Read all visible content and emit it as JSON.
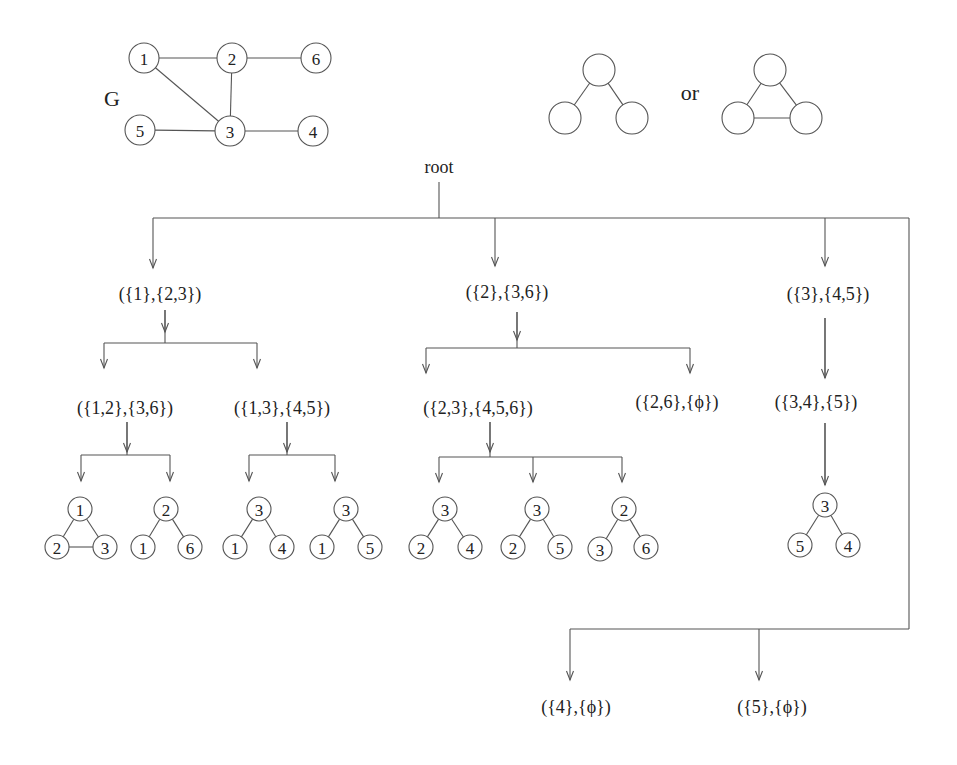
{
  "graph": {
    "label": "G",
    "label_pos": [
      112,
      98
    ],
    "node_radius": 15,
    "nodes": [
      {
        "id": "1",
        "x": 144,
        "y": 58
      },
      {
        "id": "2",
        "x": 232,
        "y": 58
      },
      {
        "id": "6",
        "x": 316,
        "y": 58
      },
      {
        "id": "5",
        "x": 140,
        "y": 130
      },
      {
        "id": "3",
        "x": 230,
        "y": 131
      },
      {
        "id": "4",
        "x": 313,
        "y": 131
      }
    ],
    "edges": [
      [
        "1",
        "2"
      ],
      [
        "2",
        "6"
      ],
      [
        "1",
        "3"
      ],
      [
        "2",
        "3"
      ],
      [
        "5",
        "3"
      ],
      [
        "3",
        "4"
      ]
    ]
  },
  "patterns": {
    "connector": "or",
    "connector_pos": [
      690,
      92
    ],
    "node_radius": 16,
    "items": [
      {
        "name": "path-pattern",
        "nodes": [
          [
            599,
            70
          ],
          [
            565,
            118
          ],
          [
            632,
            118
          ]
        ],
        "edges": [
          [
            0,
            1
          ],
          [
            0,
            2
          ]
        ]
      },
      {
        "name": "triangle-pattern",
        "nodes": [
          [
            770,
            70
          ],
          [
            738,
            118
          ],
          [
            806,
            118
          ]
        ],
        "edges": [
          [
            0,
            1
          ],
          [
            0,
            2
          ],
          [
            1,
            2
          ]
        ]
      }
    ]
  },
  "tree": {
    "root": {
      "label": "root",
      "x": 439,
      "y": 167
    },
    "labels": [
      {
        "text": "({1},{2,3})",
        "x": 160,
        "y": 294
      },
      {
        "text": "({2},{3,6})",
        "x": 507,
        "y": 292
      },
      {
        "text": "({3},{4,5})",
        "x": 828,
        "y": 294
      },
      {
        "text": "({1,2},{3,6})",
        "x": 125,
        "y": 408
      },
      {
        "text": "({1,3},{4,5})",
        "x": 282,
        "y": 408
      },
      {
        "text": "({2,3},{4,5,6})",
        "x": 478,
        "y": 408
      },
      {
        "text": "({2,6},{ϕ})",
        "x": 677,
        "y": 402
      },
      {
        "text": "({3,4},{5})",
        "x": 816,
        "y": 402
      },
      {
        "text": "({4},{ϕ})",
        "x": 576,
        "y": 707
      },
      {
        "text": "({5},{ϕ})",
        "x": 772,
        "y": 707
      }
    ],
    "lines": [
      [
        439,
        182,
        439,
        218
      ],
      [
        153,
        218,
        909,
        218
      ],
      [
        909,
        218,
        909,
        629
      ],
      [
        570,
        629,
        909,
        629
      ],
      [
        165,
        310,
        165,
        343
      ],
      [
        104,
        343,
        257,
        343
      ],
      [
        517,
        312,
        517,
        348
      ],
      [
        426,
        348,
        690,
        348
      ],
      [
        825,
        318,
        825,
        378
      ],
      [
        127,
        422,
        127,
        455
      ],
      [
        81,
        455,
        170,
        455
      ],
      [
        287,
        422,
        287,
        455
      ],
      [
        249,
        455,
        335,
        455
      ],
      [
        490,
        422,
        490,
        457
      ],
      [
        439,
        457,
        622,
        457
      ],
      [
        825,
        423,
        825,
        485
      ]
    ],
    "arrows": [
      [
        153,
        218,
        268
      ],
      [
        495,
        218,
        266
      ],
      [
        825,
        218,
        266
      ],
      [
        165,
        310,
        332
      ],
      [
        104,
        343,
        368
      ],
      [
        257,
        343,
        368
      ],
      [
        517,
        312,
        340
      ],
      [
        426,
        348,
        373
      ],
      [
        690,
        348,
        373
      ],
      [
        825,
        318,
        378
      ],
      [
        127,
        422,
        452
      ],
      [
        81,
        455,
        481
      ],
      [
        170,
        455,
        481
      ],
      [
        287,
        422,
        452
      ],
      [
        249,
        455,
        481
      ],
      [
        335,
        455,
        481
      ],
      [
        490,
        422,
        452
      ],
      [
        439,
        457,
        482
      ],
      [
        533,
        457,
        482
      ],
      [
        622,
        457,
        482
      ],
      [
        825,
        423,
        485
      ],
      [
        570,
        629,
        680
      ],
      [
        759,
        629,
        680
      ]
    ],
    "leaf_radius": 12,
    "leaves": [
      {
        "nodes": [
          {
            "id": "1",
            "x": 80,
            "y": 509
          },
          {
            "id": "2",
            "x": 57,
            "y": 547
          },
          {
            "id": "3",
            "x": 105,
            "y": 547
          }
        ],
        "edges": [
          [
            0,
            1
          ],
          [
            0,
            2
          ],
          [
            1,
            2
          ]
        ]
      },
      {
        "nodes": [
          {
            "id": "2",
            "x": 166,
            "y": 509
          },
          {
            "id": "1",
            "x": 143,
            "y": 547
          },
          {
            "id": "6",
            "x": 190,
            "y": 547
          }
        ],
        "edges": [
          [
            0,
            1
          ],
          [
            0,
            2
          ]
        ]
      },
      {
        "nodes": [
          {
            "id": "3",
            "x": 259,
            "y": 509
          },
          {
            "id": "1",
            "x": 235,
            "y": 547
          },
          {
            "id": "4",
            "x": 282,
            "y": 547
          }
        ],
        "edges": [
          [
            0,
            1
          ],
          [
            0,
            2
          ]
        ]
      },
      {
        "nodes": [
          {
            "id": "3",
            "x": 346,
            "y": 509
          },
          {
            "id": "1",
            "x": 322,
            "y": 547
          },
          {
            "id": "5",
            "x": 370,
            "y": 547
          }
        ],
        "edges": [
          [
            0,
            1
          ],
          [
            0,
            2
          ]
        ]
      },
      {
        "nodes": [
          {
            "id": "3",
            "x": 445,
            "y": 509
          },
          {
            "id": "2",
            "x": 421,
            "y": 547
          },
          {
            "id": "4",
            "x": 470,
            "y": 547
          }
        ],
        "edges": [
          [
            0,
            1
          ],
          [
            0,
            2
          ]
        ]
      },
      {
        "nodes": [
          {
            "id": "3",
            "x": 537,
            "y": 509
          },
          {
            "id": "2",
            "x": 513,
            "y": 547
          },
          {
            "id": "5",
            "x": 560,
            "y": 547
          }
        ],
        "edges": [
          [
            0,
            1
          ],
          [
            0,
            2
          ]
        ]
      },
      {
        "nodes": [
          {
            "id": "2",
            "x": 624,
            "y": 509
          },
          {
            "id": "3",
            "x": 600,
            "y": 549
          },
          {
            "id": "6",
            "x": 646,
            "y": 547
          }
        ],
        "edges": [
          [
            0,
            1
          ],
          [
            0,
            2
          ]
        ]
      },
      {
        "nodes": [
          {
            "id": "3",
            "x": 825,
            "y": 505
          },
          {
            "id": "5",
            "x": 800,
            "y": 545
          },
          {
            "id": "4",
            "x": 848,
            "y": 545
          }
        ],
        "edges": [
          [
            0,
            1
          ],
          [
            0,
            2
          ]
        ]
      }
    ]
  }
}
